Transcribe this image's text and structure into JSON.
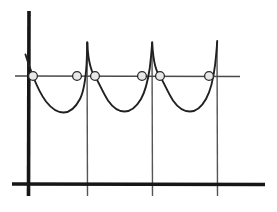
{
  "figure": {
    "kind": "line-graph-sketch",
    "canvas": {
      "width": 277,
      "height": 212
    },
    "colors": {
      "background": "#ffffff",
      "ink": "#1a1a1a",
      "axis_heavy": "#161616",
      "axis_light": "#4a4a4a",
      "asymptote": "#555555",
      "curve": "#202020",
      "marker_fill": "#e8e8e8",
      "marker_stroke": "#2a2a2a"
    },
    "stroke_widths": {
      "axis_heavy": 3.6,
      "axis_light": 1.4,
      "asymptote": 1.4,
      "curve": 1.9,
      "marker": 1.3
    }
  },
  "chart_data": {
    "type": "line",
    "title": "",
    "xlabel": "",
    "ylabel": "",
    "grid": false,
    "legend": null,
    "axes": {
      "y_axis": {
        "x": 29,
        "y_top": 11,
        "y_bottom": 196,
        "weight": "heavy"
      },
      "x_axis_baseline": {
        "y": 184,
        "x_left": 12,
        "x_right": 265,
        "weight": "heavy"
      },
      "x_axis_midline": {
        "y": 76,
        "x_left": 15,
        "x_right": 240,
        "weight": "light"
      }
    },
    "asymptotes": {
      "count": 3,
      "x_positions": [
        87,
        152,
        217
      ],
      "y_top": 42,
      "y_bottom": 196
    },
    "markers": {
      "shape": "open-circle",
      "radius": 4.4,
      "count": 6,
      "points": [
        {
          "x": 33,
          "y": 76
        },
        {
          "x": 77,
          "y": 76
        },
        {
          "x": 95,
          "y": 76
        },
        {
          "x": 142,
          "y": 76
        },
        {
          "x": 160,
          "y": 76
        },
        {
          "x": 209,
          "y": 76
        }
      ]
    },
    "curve_segments": [
      {
        "name": "rising-branch-left-edge",
        "points": [
          [
            26,
            56
          ],
          [
            30,
            68
          ],
          [
            33,
            76
          ],
          [
            38,
            88
          ],
          [
            45,
            101
          ],
          [
            54,
            110
          ],
          [
            63,
            112
          ],
          [
            72,
            105
          ],
          [
            80,
            90
          ],
          [
            85,
            66
          ],
          [
            87,
            43
          ]
        ]
      },
      {
        "name": "arch-one",
        "points": [
          [
            87,
            43
          ],
          [
            91,
            60
          ],
          [
            95,
            76
          ],
          [
            101,
            90
          ],
          [
            110,
            103
          ],
          [
            119,
            110
          ],
          [
            128,
            110
          ],
          [
            137,
            102
          ],
          [
            145,
            88
          ],
          [
            150,
            66
          ],
          [
            152,
            43
          ]
        ]
      },
      {
        "name": "arch-two",
        "points": [
          [
            152,
            43
          ],
          [
            156,
            60
          ],
          [
            160,
            76
          ],
          [
            166,
            90
          ],
          [
            175,
            103
          ],
          [
            184,
            110
          ],
          [
            193,
            110
          ],
          [
            201,
            101
          ],
          [
            209,
            85
          ],
          [
            214,
            62
          ],
          [
            217,
            41
          ]
        ]
      }
    ],
    "x": [
      26,
      33,
      63,
      87,
      95,
      119,
      152,
      160,
      188,
      209,
      217
    ],
    "y": [
      56,
      76,
      112,
      43,
      76,
      110,
      43,
      76,
      110,
      76,
      41
    ],
    "xlim": [
      12,
      265
    ],
    "ylim": [
      196,
      11
    ]
  }
}
